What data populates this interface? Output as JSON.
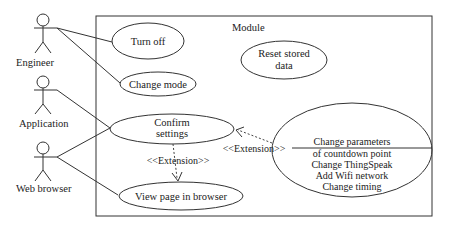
{
  "diagram": {
    "type": "UML use case diagram",
    "system_boundary": {
      "label": "Module"
    },
    "actors": [
      {
        "id": "engineer",
        "label": "Engineer"
      },
      {
        "id": "application",
        "label": "Application"
      },
      {
        "id": "web_browser",
        "label": "Web browser"
      }
    ],
    "use_cases": [
      {
        "id": "turn_off",
        "lines": [
          "Turn off"
        ]
      },
      {
        "id": "change_mode",
        "lines": [
          "Change mode"
        ]
      },
      {
        "id": "reset_stored_data",
        "lines": [
          "Reset stored",
          "data"
        ]
      },
      {
        "id": "confirm_settings",
        "lines": [
          "Confirm",
          "settings"
        ]
      },
      {
        "id": "view_page",
        "lines": [
          "View page in browser"
        ]
      },
      {
        "id": "change_settings",
        "lines": [
          "Change parameters",
          "of countdown point",
          "Change ThingSpeak",
          "Add Wifi network",
          "Change timing"
        ]
      }
    ],
    "relations": [
      {
        "from": "engineer",
        "to": "turn_off",
        "type": "association"
      },
      {
        "from": "engineer",
        "to": "change_mode",
        "type": "association"
      },
      {
        "from": "application",
        "to": "confirm_settings",
        "type": "association"
      },
      {
        "from": "web_browser",
        "to": "confirm_settings",
        "type": "association"
      },
      {
        "from": "web_browser",
        "to": "view_page",
        "type": "association"
      },
      {
        "from": "confirm_settings",
        "to": "view_page",
        "type": "extension",
        "label": "<<Extension>>"
      },
      {
        "from": "change_settings",
        "to": "confirm_settings",
        "type": "extension",
        "label": "<<Extension>>"
      }
    ]
  }
}
